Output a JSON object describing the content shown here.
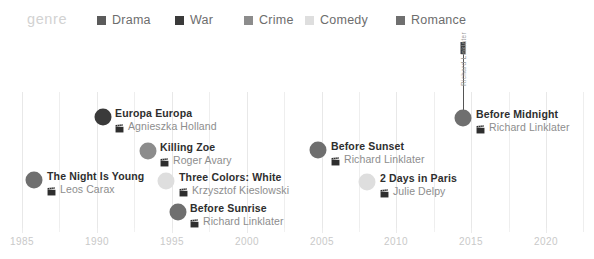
{
  "legend": {
    "title": "genre",
    "items": [
      {
        "label": "Drama",
        "color": "#5b5b5b",
        "swatch_icon": "square-swatch",
        "x": 97
      },
      {
        "label": "War",
        "color": "#3a3a3a",
        "swatch_icon": "square-swatch",
        "x": 175
      },
      {
        "label": "Crime",
        "color": "#8c8c8c",
        "swatch_icon": "square-swatch",
        "x": 244
      },
      {
        "label": "Comedy",
        "color": "#dedede",
        "swatch_icon": "square-swatch",
        "x": 305
      },
      {
        "label": "Romance",
        "color": "#6f6f6f",
        "swatch_icon": "square-swatch",
        "x": 396
      }
    ]
  },
  "axis": {
    "tick_labels": [
      "1985",
      "1990",
      "1995",
      "2000",
      "2005",
      "2010",
      "2015",
      "2020"
    ],
    "tick_x": [
      22,
      97,
      172,
      247,
      322,
      396,
      471,
      546
    ],
    "minor_tick_x": [
      59,
      134,
      209,
      284,
      359,
      434,
      509
    ],
    "range_min": 1985,
    "range_max": 2020
  },
  "grid": {
    "x": [
      22,
      59,
      97,
      134,
      172,
      209,
      247,
      284,
      322,
      359,
      396,
      434,
      471,
      509,
      546,
      583
    ],
    "visible": true
  },
  "annotation": {
    "text": "Richard Linklater",
    "line_x": 463,
    "line_top": 52,
    "line_bottom": 118,
    "cap_y": 42
  },
  "chart_data": {
    "type": "scatter",
    "title": "",
    "xlabel": "",
    "ylabel": "",
    "xlim": [
      1983.5,
      2021.5
    ],
    "grid": true,
    "legend_position": "top",
    "legend_entries": [
      "Drama",
      "War",
      "Crime",
      "Comedy",
      "Romance"
    ],
    "series_field": "genre",
    "points": [
      {
        "title": "The Night Is Young",
        "director": "Leos Carax",
        "genre": "Romance",
        "year": 1986,
        "color": "#6f6f6f",
        "dot_x": 34,
        "dot_y": 180,
        "dot_r": 8.5,
        "label_x": 47,
        "label_y": 170,
        "icon": "film-clapper-icon"
      },
      {
        "title": "Europa Europa",
        "director": "Agnieszka Holland",
        "genre": "War",
        "year": 1990,
        "color": "#3a3a3a",
        "dot_x": 103,
        "dot_y": 117,
        "dot_r": 8.5,
        "label_x": 115,
        "label_y": 107,
        "icon": "film-clapper-icon"
      },
      {
        "title": "Killing Zoe",
        "director": "Roger Avary",
        "genre": "Crime",
        "year": 1993,
        "color": "#8c8c8c",
        "dot_r": 8.5,
        "dot_x": 148,
        "dot_y": 151,
        "label_x": 160,
        "label_y": 141,
        "icon": "film-clapper-icon"
      },
      {
        "title": "Three Colors: White",
        "director": "Krzysztof Kieslowski",
        "genre": "Comedy",
        "year": 1994,
        "color": "#dedede",
        "dot_r": 8.5,
        "dot_x": 166,
        "dot_y": 181,
        "label_x": 179,
        "label_y": 171,
        "icon": "film-clapper-icon"
      },
      {
        "title": "Before Sunrise",
        "director": "Richard Linklater",
        "genre": "Romance",
        "year": 1995,
        "color": "#6f6f6f",
        "dot_r": 8.5,
        "dot_x": 178,
        "dot_y": 212,
        "label_x": 190,
        "label_y": 202,
        "icon": "film-clapper-icon"
      },
      {
        "title": "Before Sunset",
        "director": "Richard Linklater",
        "genre": "Romance",
        "year": 2004,
        "color": "#6f6f6f",
        "dot_r": 8.5,
        "dot_x": 318,
        "dot_y": 150,
        "label_x": 331,
        "label_y": 140,
        "icon": "film-clapper-icon"
      },
      {
        "title": "2 Days in Paris",
        "director": "Julie Delpy",
        "genre": "Comedy",
        "year": 2007,
        "color": "#dedede",
        "dot_r": 8.5,
        "dot_x": 367,
        "dot_y": 182,
        "label_x": 380,
        "label_y": 172,
        "icon": "film-clapper-icon"
      },
      {
        "title": "Before Midnight",
        "director": "Richard Linklater",
        "genre": "Romance",
        "year": 2013,
        "color": "#6f6f6f",
        "dot_r": 8.5,
        "dot_x": 463,
        "dot_y": 118,
        "label_x": 476,
        "label_y": 108,
        "icon": "film-clapper-icon"
      }
    ]
  }
}
